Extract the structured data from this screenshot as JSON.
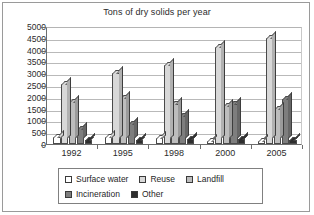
{
  "chart_data": {
    "type": "bar",
    "title": "Tons of dry solids per year",
    "xlabel": "",
    "ylabel": "",
    "ylim": [
      0,
      5000
    ],
    "ytick_step": 500,
    "yticks": [
      "5000",
      "4500",
      "4000",
      "3500",
      "3000",
      "2500",
      "2000",
      "1500",
      "1000",
      "500",
      "0"
    ],
    "grid": true,
    "legend_position": "bottom",
    "categories": [
      "1992",
      "1995",
      "1998",
      "2000",
      "2005"
    ],
    "series": [
      {
        "name": "Surface water",
        "color": "#ffffff",
        "values": [
          280,
          300,
          260,
          120,
          110
        ]
      },
      {
        "name": "Reuse",
        "color": "#d8d8d8",
        "values": [
          2550,
          3000,
          3350,
          4100,
          4500
        ]
      },
      {
        "name": "Landfill",
        "color": "#bdbdbd",
        "values": [
          1780,
          1930,
          1700,
          1630,
          1480
        ]
      },
      {
        "name": "Incineration",
        "color": "#7e7e7e",
        "values": [
          620,
          850,
          1200,
          1680,
          1900
        ]
      },
      {
        "name": "Other",
        "color": "#2e2e2e",
        "values": [
          160,
          180,
          210,
          200,
          190
        ]
      }
    ]
  },
  "legend": {
    "rows": [
      [
        {
          "label": "Surface water",
          "swatch": "#ffffff"
        },
        {
          "label": "Reuse",
          "swatch": "#d8d8d8"
        },
        {
          "label": "Landfill",
          "swatch": "#bdbdbd"
        }
      ],
      [
        {
          "label": "Incineration",
          "swatch": "#7e7e7e"
        },
        {
          "label": "Other",
          "swatch": "#2e2e2e"
        }
      ]
    ]
  }
}
